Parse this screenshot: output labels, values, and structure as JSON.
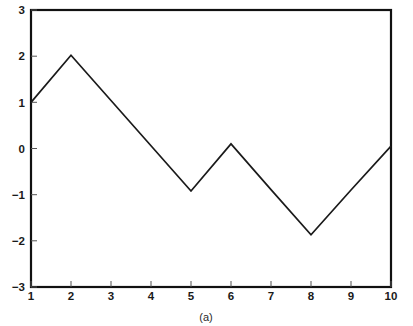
{
  "chart_data": {
    "type": "line",
    "title": "",
    "subtitle": "",
    "caption": "(a)",
    "xlabel": "",
    "ylabel": "",
    "x": [
      1,
      2,
      3,
      4,
      5,
      6,
      7,
      8,
      9,
      10
    ],
    "values": [
      1.0,
      2.02,
      1.04,
      0.06,
      -0.92,
      0.1,
      -0.89,
      -1.87,
      -0.9,
      0.05
    ],
    "series": [
      {
        "name": "",
        "values": [
          1.0,
          2.02,
          1.04,
          0.06,
          -0.92,
          0.1,
          -0.89,
          -1.87,
          -0.9,
          0.05
        ]
      }
    ],
    "xlim": [
      1,
      10
    ],
    "ylim": [
      -3,
      3
    ],
    "xticks": [
      1,
      2,
      3,
      4,
      5,
      6,
      7,
      8,
      9,
      10
    ],
    "xticklabels": [
      "1",
      "2",
      "3",
      "4",
      "5",
      "6",
      "7",
      "8",
      "9",
      "10"
    ],
    "yticks": [
      3,
      2,
      1,
      0,
      -1,
      -2,
      -3
    ],
    "yticklabels": [
      "3",
      "2",
      "1",
      "0",
      "−1",
      "−2",
      "−3"
    ],
    "grid": false,
    "legend": false,
    "legend_position": "none",
    "line_color": "#1a1a1a",
    "axis_color": "#111111",
    "background_color": "#ffffff"
  },
  "figure": {
    "caption": "(a)"
  }
}
